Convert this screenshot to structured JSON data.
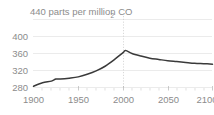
{
  "chart_data": {
    "type": "line",
    "title": "440 parts per million CO",
    "title_subscript": "2",
    "title_full": "440 parts per million CO2",
    "xlabel": "",
    "ylabel": "",
    "xlim": [
      1900,
      2100
    ],
    "ylim": [
      275,
      445
    ],
    "x_ticks": [
      1900,
      1950,
      2000,
      2050,
      2100
    ],
    "x_tick_labels": [
      "1900",
      "1950",
      "2000",
      "2050",
      "2100"
    ],
    "y_ticks": [
      280,
      320,
      360,
      400,
      440
    ],
    "y_tick_labels": [
      "280",
      "320",
      "360",
      "400",
      "440"
    ],
    "y_tick_labels_drawn": [
      "280",
      "320",
      "360",
      "400"
    ],
    "grid": "horizontal-gridlines-plus-dotted-vertical-at-2000",
    "legend": "none",
    "annotations": [
      {
        "name": "present-day-marker",
        "x": 2000,
        "style": "dotted vertical line"
      }
    ],
    "series": [
      {
        "name": "Atmospheric CO2 concentration",
        "color": "#3a3a3a",
        "x": [
          1900,
          1910,
          1920,
          1925,
          1930,
          1940,
          1950,
          1960,
          1970,
          1980,
          1990,
          2000,
          2003,
          2010,
          2020,
          2030,
          2040,
          2050,
          2060,
          2070,
          2080,
          2090,
          2100
        ],
        "values": [
          283,
          291,
          295,
          300,
          300,
          302,
          305,
          311,
          319,
          330,
          345,
          362,
          367,
          360,
          354,
          349,
          346,
          343,
          341,
          339,
          337,
          336,
          335
        ]
      }
    ],
    "peak": {
      "x": 2003,
      "y": 367
    },
    "units": "parts per million"
  },
  "axis_colors": {
    "tick_text": "#8c8c8c",
    "gridline": "#e2e2e2",
    "dotted_vertical": "#c9c9c9",
    "series": "#3a3a3a"
  }
}
